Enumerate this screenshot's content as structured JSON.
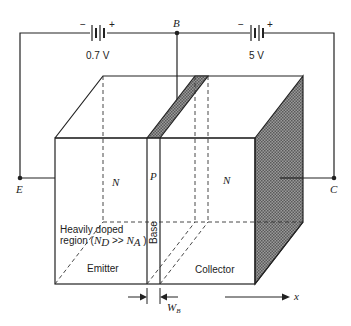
{
  "diagram": {
    "nodes": {
      "base": "B",
      "emitter": "E",
      "collector": "C"
    },
    "batteries": [
      {
        "id": "emitter-base",
        "voltage": "0.7 V",
        "minus": "−",
        "plus": "+"
      },
      {
        "id": "collector-base",
        "voltage": "5 V",
        "minus": "−",
        "plus": "+"
      }
    ],
    "regions": {
      "emitter_type": "N",
      "base_type": "P",
      "collector_type": "N",
      "emitter_label": "Emitter",
      "base_label": "Base",
      "collector_label": "Collector"
    },
    "annotation": {
      "line1": "Heavily doped",
      "line2_prefix": "region (",
      "nd": "N",
      "nd_sub": "D",
      "relation": " >> ",
      "na": "N",
      "na_sub": "A",
      "line2_suffix": " )"
    },
    "dimension": {
      "base_width": "W",
      "base_width_sub": "B"
    },
    "axis": {
      "label": "x"
    },
    "colors": {
      "line": "#222222",
      "hatch": "#777777",
      "background": "#ffffff"
    }
  }
}
